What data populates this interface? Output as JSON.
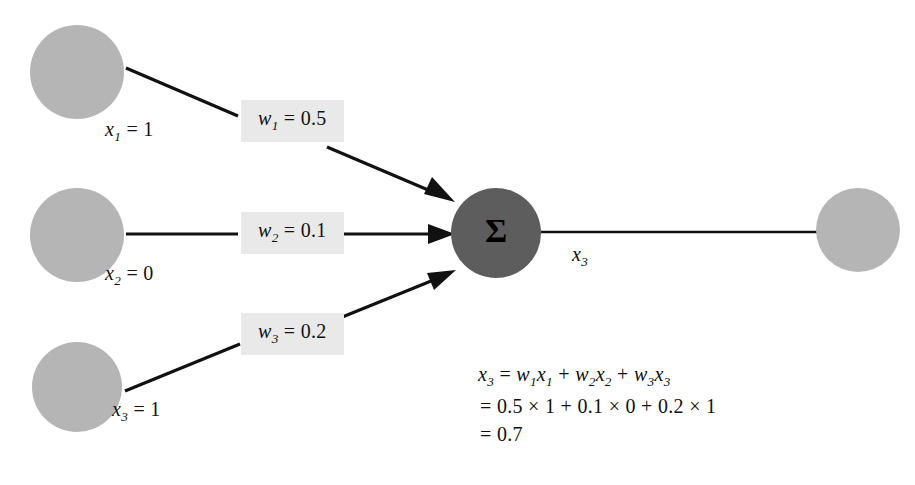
{
  "diagram": {
    "colors": {
      "node_fill": "#b5b5b5",
      "sum_node_fill": "#5d5d5d",
      "edge_stroke": "#111111",
      "weight_chip_bg": "#e9e9e9",
      "background": "#ffffff",
      "text": "#111111"
    },
    "sum_node": {
      "symbol": "Σ",
      "name": "summation-node"
    },
    "inputs": [
      {
        "id": "x1",
        "label_var": "x",
        "label_sub": "1",
        "label_value": "= 1",
        "label_text": "x1 = 1"
      },
      {
        "id": "x2",
        "label_var": "x",
        "label_sub": "2",
        "label_value": "= 0",
        "label_text": "x2 = 0"
      },
      {
        "id": "x3",
        "label_var": "x",
        "label_sub": "3",
        "label_value": "= 1",
        "label_text": "x3 = 1"
      }
    ],
    "weights": [
      {
        "id": "w1",
        "label_var": "w",
        "label_sub": "1",
        "label_value": "= 0.5",
        "label_text": "w1 = 0.5"
      },
      {
        "id": "w2",
        "label_var": "w",
        "label_sub": "2",
        "label_value": "= 0.1",
        "label_text": "w2 = 0.1"
      },
      {
        "id": "w3",
        "label_var": "w",
        "label_sub": "3",
        "label_value": "= 0.2",
        "label_text": "w3 = 0.2"
      }
    ],
    "output": {
      "edge_label_var": "x",
      "edge_label_sub": "3",
      "edge_label_text": "x3"
    },
    "formula": {
      "line1": {
        "lhs_var": "x",
        "lhs_sub": "3",
        "rhs": "= w1x1 + w2x2 + w3x3"
      },
      "line2": "= 0.5 × 1 + 0.1 × 0 + 0.2 × 1",
      "line3": "= 0.7"
    }
  }
}
